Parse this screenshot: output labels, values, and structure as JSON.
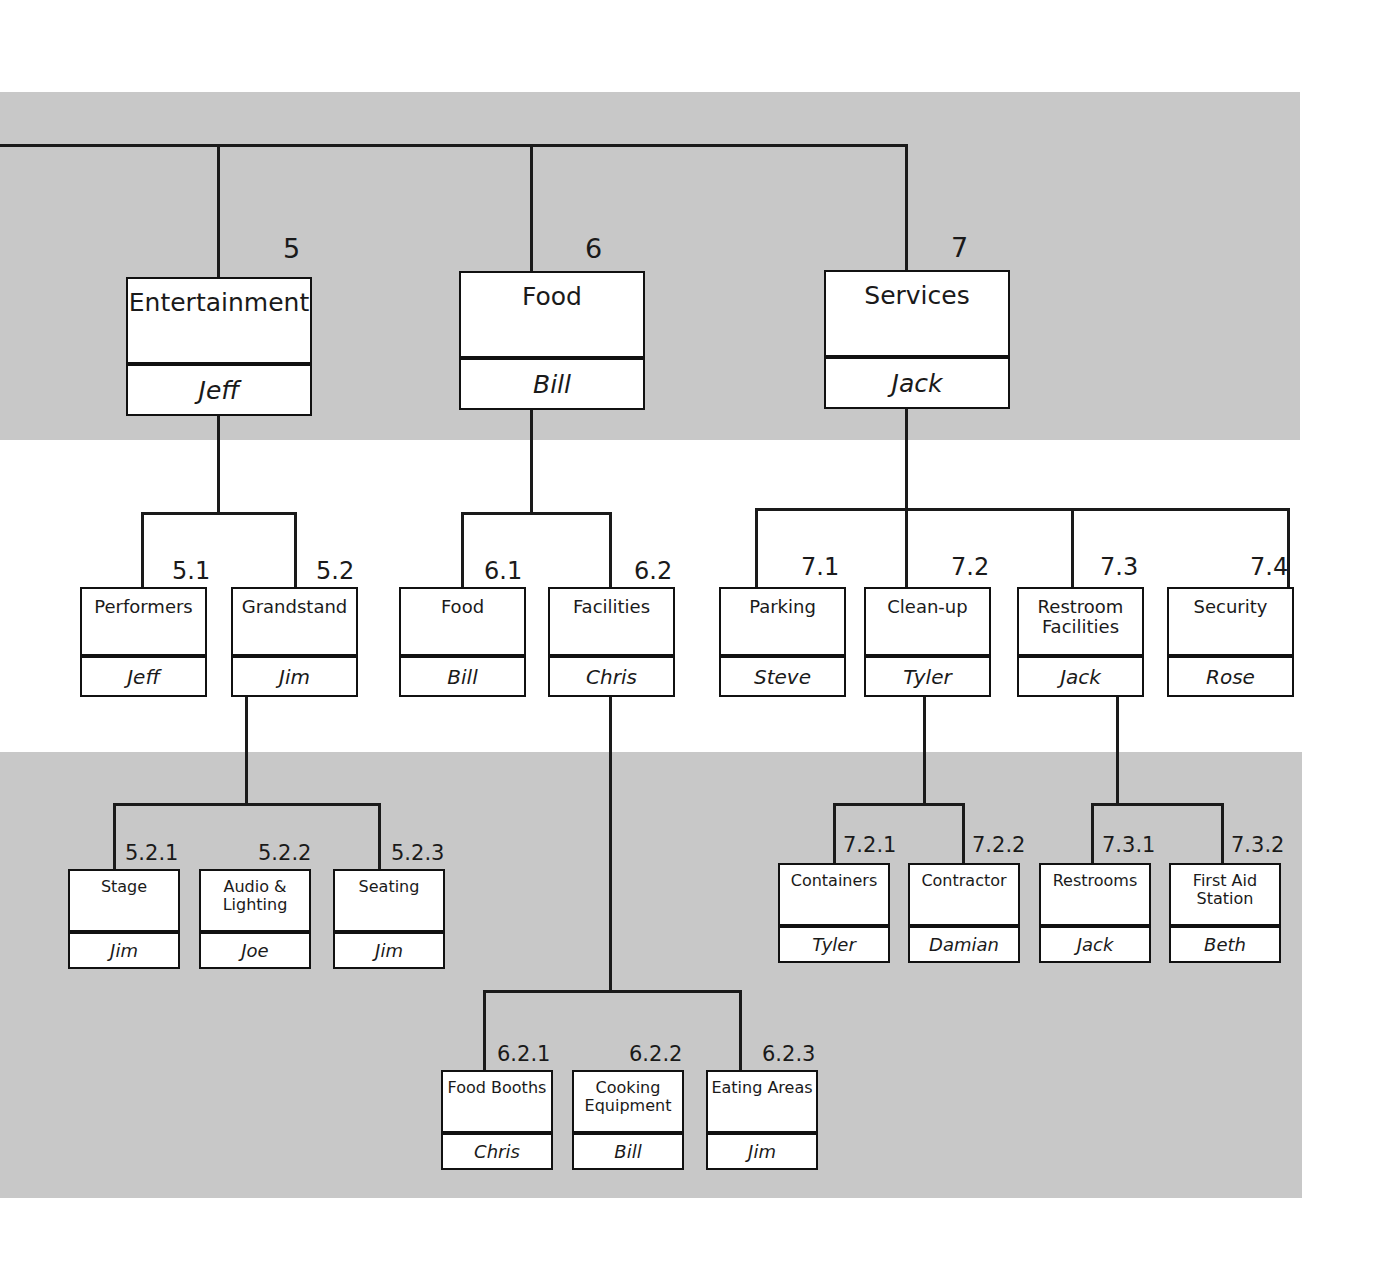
{
  "diagram": {
    "type": "work-breakdown-structure",
    "style": {
      "band_color": "#c8c8c8",
      "box_fill": "#ffffff",
      "line_color": "#1a1a1a"
    },
    "nodes": [
      {
        "code": "5",
        "title": "Entertainment",
        "owner": "Jeff"
      },
      {
        "code": "6",
        "title": "Food",
        "owner": "Bill"
      },
      {
        "code": "7",
        "title": "Services",
        "owner": "Jack"
      },
      {
        "code": "5.1",
        "title": "Performers",
        "owner": "Jeff"
      },
      {
        "code": "5.2",
        "title": "Grandstand",
        "owner": "Jim"
      },
      {
        "code": "6.1",
        "title": "Food",
        "owner": "Bill"
      },
      {
        "code": "6.2",
        "title": "Facilities",
        "owner": "Chris"
      },
      {
        "code": "7.1",
        "title": "Parking",
        "owner": "Steve"
      },
      {
        "code": "7.2",
        "title": "Clean-up",
        "owner": "Tyler"
      },
      {
        "code": "7.3",
        "title": "Restroom Facilities",
        "owner": "Jack"
      },
      {
        "code": "7.4",
        "title": "Security",
        "owner": "Rose"
      },
      {
        "code": "5.2.1",
        "title": "Stage",
        "owner": "Jim"
      },
      {
        "code": "5.2.2",
        "title": "Audio & Lighting",
        "owner": "Joe"
      },
      {
        "code": "5.2.3",
        "title": "Seating",
        "owner": "Jim"
      },
      {
        "code": "7.2.1",
        "title": "Containers",
        "owner": "Tyler"
      },
      {
        "code": "7.2.2",
        "title": "Contractor",
        "owner": "Damian"
      },
      {
        "code": "7.3.1",
        "title": "Restrooms",
        "owner": "Jack"
      },
      {
        "code": "7.3.2",
        "title": "First Aid Station",
        "owner": "Beth"
      },
      {
        "code": "6.2.1",
        "title": "Food Booths",
        "owner": "Chris"
      },
      {
        "code": "6.2.2",
        "title": "Cooking Equipment",
        "owner": "Bill"
      },
      {
        "code": "6.2.3",
        "title": "Eating Areas",
        "owner": "Jim"
      }
    ]
  }
}
